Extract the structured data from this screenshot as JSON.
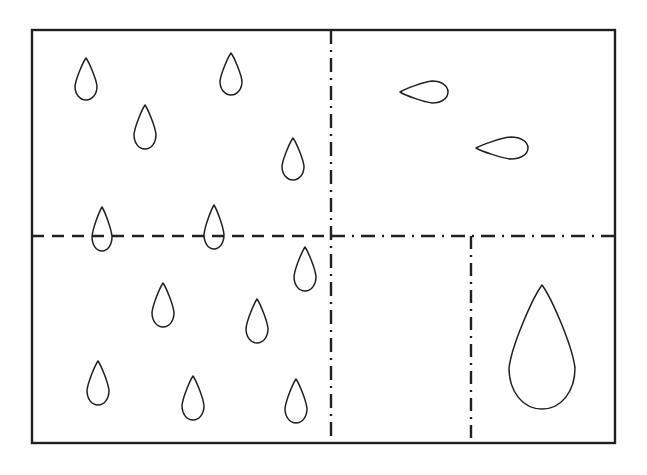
{
  "figure": {
    "background_color": "#ffffff",
    "stroke_color": "#231f20",
    "canvas": {
      "width": 647,
      "height": 475
    },
    "frame": {
      "name": "outer-border",
      "x": 32,
      "y": 30,
      "width": 583,
      "height": 413,
      "stroke_width": 2.4,
      "style": "solid",
      "fill": "none"
    },
    "dividers": [
      {
        "name": "vertical-center-divider",
        "orientation": "vertical",
        "style": "dash-dot",
        "dash_array": "14,6,2,6",
        "stroke_width": 2.4,
        "x1": 331,
        "y1": 30,
        "x2": 331,
        "y2": 443
      },
      {
        "name": "horizontal-divider-left",
        "orientation": "horizontal",
        "style": "dashed",
        "dash_array": "12,8",
        "stroke_width": 2.6,
        "x1": 32,
        "y1": 236,
        "x2": 331,
        "y2": 236
      },
      {
        "name": "horizontal-divider-right",
        "orientation": "horizontal",
        "style": "dash-dot",
        "dash_array": "14,7,2,7",
        "stroke_width": 2.6,
        "x1": 331,
        "y1": 236,
        "x2": 615,
        "y2": 236
      },
      {
        "name": "vertical-lower-right-divider",
        "orientation": "vertical",
        "style": "dash-dot",
        "dash_array": "13,6,2,6",
        "stroke_width": 2.4,
        "x1": 471,
        "y1": 236,
        "x2": 471,
        "y2": 443
      }
    ],
    "quadrants": [
      {
        "name": "quadrant-top-left",
        "droplet_count": 4,
        "droplet_form": "small-vertical-teardrop"
      },
      {
        "name": "quadrant-top-right",
        "droplet_count": 2,
        "droplet_form": "horizontal-teardrop"
      },
      {
        "name": "quadrant-bottom-left",
        "droplet_count": 7,
        "droplet_form": "small-vertical-teardrop"
      },
      {
        "name": "quadrant-bottom-right",
        "droplet_count": 1,
        "droplet_form": "large-vertical-teardrop"
      },
      {
        "name": "boundary-straddling",
        "droplet_count": 2,
        "droplet_form": "small-vertical-teardrop"
      }
    ],
    "droplets": [
      {
        "id": "droplet-tl-1",
        "region": "top-left",
        "cx": 86,
        "cy": 79,
        "rx": 11,
        "ry": 21,
        "rotation": 0,
        "stroke_width": 1.5
      },
      {
        "id": "droplet-tl-2",
        "region": "top-left",
        "cx": 145,
        "cy": 127,
        "rx": 11,
        "ry": 22,
        "rotation": 0,
        "stroke_width": 1.5
      },
      {
        "id": "droplet-tl-3",
        "region": "top-left",
        "cx": 231,
        "cy": 74,
        "rx": 11,
        "ry": 21,
        "rotation": 0,
        "stroke_width": 1.5
      },
      {
        "id": "droplet-tl-4",
        "region": "top-left",
        "cx": 293,
        "cy": 159,
        "rx": 11,
        "ry": 21,
        "rotation": 0,
        "stroke_width": 1.5
      },
      {
        "id": "droplet-mid-1",
        "region": "straddle",
        "cx": 102,
        "cy": 229,
        "rx": 10,
        "ry": 22,
        "rotation": 0,
        "stroke_width": 1.5
      },
      {
        "id": "droplet-mid-2",
        "region": "straddle",
        "cx": 214,
        "cy": 227,
        "rx": 10,
        "ry": 22,
        "rotation": 0,
        "stroke_width": 1.5
      },
      {
        "id": "droplet-tr-1",
        "region": "top-right",
        "cx": 424,
        "cy": 92,
        "rx": 11,
        "ry": 24,
        "rotation": -90,
        "stroke_width": 1.5
      },
      {
        "id": "droplet-tr-2",
        "region": "top-right",
        "cx": 502,
        "cy": 148,
        "rx": 11,
        "ry": 26,
        "rotation": -90,
        "stroke_width": 1.5
      },
      {
        "id": "droplet-bl-1",
        "region": "bottom-left",
        "cx": 305,
        "cy": 269,
        "rx": 11,
        "ry": 22,
        "rotation": 0,
        "stroke_width": 1.5
      },
      {
        "id": "droplet-bl-2",
        "region": "bottom-left",
        "cx": 163,
        "cy": 305,
        "rx": 11,
        "ry": 22,
        "rotation": 0,
        "stroke_width": 1.5
      },
      {
        "id": "droplet-bl-3",
        "region": "bottom-left",
        "cx": 257,
        "cy": 321,
        "rx": 11,
        "ry": 22,
        "rotation": 0,
        "stroke_width": 1.5
      },
      {
        "id": "droplet-bl-4",
        "region": "bottom-left",
        "cx": 98,
        "cy": 383,
        "rx": 11,
        "ry": 22,
        "rotation": 0,
        "stroke_width": 1.5
      },
      {
        "id": "droplet-bl-5",
        "region": "bottom-left",
        "cx": 193,
        "cy": 398,
        "rx": 11,
        "ry": 22,
        "rotation": 0,
        "stroke_width": 1.5
      },
      {
        "id": "droplet-bl-6",
        "region": "bottom-left",
        "cx": 296,
        "cy": 401,
        "rx": 11,
        "ry": 22,
        "rotation": 0,
        "stroke_width": 1.5
      },
      {
        "id": "droplet-br-1",
        "region": "bottom-right",
        "cx": 542,
        "cy": 347,
        "rx": 33,
        "ry": 62,
        "rotation": 0,
        "stroke_width": 1.5
      }
    ]
  }
}
